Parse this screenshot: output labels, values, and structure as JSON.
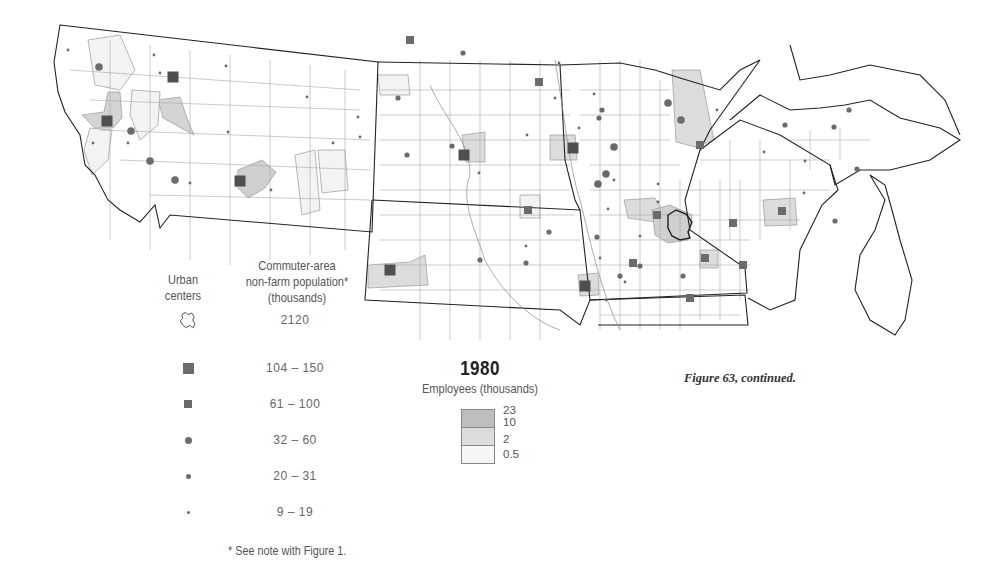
{
  "figure": {
    "caption": "Figure 63, continued.",
    "footnote": "* See note with Figure 1."
  },
  "legend_symbols": {
    "urban_header": "Urban centers",
    "urban_header_lines": [
      "Urban",
      "centers"
    ],
    "population_header_lines": [
      "Commuter-area",
      "non-farm population*",
      "(thousands)"
    ],
    "rows": [
      {
        "symbol": "urban-outline-icon",
        "value": "2120"
      },
      {
        "symbol": "large-square-icon",
        "value": "104 – 150"
      },
      {
        "symbol": "small-square-icon",
        "value": "61 – 100"
      },
      {
        "symbol": "large-dot-icon",
        "value": "32 – 60"
      },
      {
        "symbol": "medium-dot-icon",
        "value": "20 – 31"
      },
      {
        "symbol": "small-dot-icon",
        "value": "9 – 19"
      }
    ]
  },
  "legend_shading": {
    "year": "1980",
    "label": "Employees (thousands)",
    "breaks": [
      "23",
      "10",
      "2",
      "0.5"
    ],
    "colors": [
      "#bdbdbd",
      "#dcdcdc",
      "#f4f4f4"
    ]
  },
  "colors": {
    "symbol": "#6b6b6b",
    "boundary": "#222222",
    "county": "#9a9a9a",
    "shade_high": "#bdbdbd",
    "shade_mid": "#dcdcdc",
    "shade_low": "#f3f3f3"
  },
  "map": {
    "region": "Montana, North Dakota, South Dakota, Minnesota, Iowa (north), Wisconsin, Upper Michigan",
    "large_squares": [
      [
        173,
        77
      ],
      [
        240,
        181
      ],
      [
        107,
        121
      ],
      [
        464,
        155
      ],
      [
        390,
        270
      ],
      [
        573,
        148
      ],
      [
        585,
        286
      ]
    ],
    "small_squares": [
      [
        410,
        40
      ],
      [
        539,
        82
      ],
      [
        528,
        210
      ],
      [
        700,
        145
      ],
      [
        657,
        215
      ],
      [
        733,
        223
      ],
      [
        705,
        258
      ],
      [
        690,
        298
      ],
      [
        782,
        211
      ],
      [
        743,
        265
      ],
      [
        633,
        263
      ]
    ],
    "large_dots": [
      [
        99,
        67
      ],
      [
        131,
        131
      ],
      [
        175,
        180
      ],
      [
        150,
        161
      ],
      [
        681,
        120
      ],
      [
        668,
        103
      ],
      [
        606,
        174
      ],
      [
        614,
        147
      ],
      [
        598,
        184
      ]
    ],
    "medium_dots": [
      [
        398,
        98
      ],
      [
        407,
        155
      ],
      [
        463,
        53
      ],
      [
        452,
        146
      ],
      [
        597,
        237
      ],
      [
        602,
        110
      ],
      [
        599,
        118
      ],
      [
        526,
        263
      ],
      [
        480,
        260
      ],
      [
        549,
        232
      ],
      [
        640,
        266
      ],
      [
        620,
        276
      ],
      [
        683,
        276
      ],
      [
        857,
        169
      ],
      [
        849,
        110
      ],
      [
        835,
        221
      ],
      [
        834,
        127
      ],
      [
        785,
        125
      ]
    ],
    "small_dots": [
      [
        68,
        50
      ],
      [
        154,
        55
      ],
      [
        160,
        73
      ],
      [
        226,
        66
      ],
      [
        307,
        97
      ],
      [
        333,
        143
      ],
      [
        358,
        117
      ],
      [
        360,
        137
      ],
      [
        128,
        143
      ],
      [
        93,
        143
      ],
      [
        190,
        183
      ],
      [
        271,
        190
      ],
      [
        228,
        132
      ],
      [
        479,
        173
      ],
      [
        555,
        98
      ],
      [
        526,
        246
      ],
      [
        527,
        135
      ],
      [
        559,
        63
      ],
      [
        579,
        128
      ],
      [
        594,
        94
      ],
      [
        608,
        209
      ],
      [
        614,
        180
      ],
      [
        600,
        258
      ],
      [
        606,
        300
      ],
      [
        625,
        282
      ],
      [
        640,
        236
      ],
      [
        658,
        202
      ],
      [
        658,
        184
      ],
      [
        717,
        110
      ],
      [
        764,
        152
      ],
      [
        805,
        161
      ],
      [
        804,
        193
      ]
    ]
  }
}
